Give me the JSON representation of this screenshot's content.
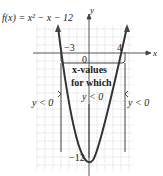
{
  "function_label": "f(x) = x² − x − 12",
  "axes": {
    "x_label": "x",
    "y_label": "y",
    "origin_label": "0"
  },
  "intercepts": {
    "left": "−3",
    "right": "4"
  },
  "vertex_label": "−12",
  "annotation": {
    "line1": "x-values",
    "line2": "for which",
    "line3": "y < 0"
  },
  "side_labels": {
    "left": "y < 0",
    "right": "y < 0"
  },
  "colors": {
    "curve": "#333333",
    "grid": "#b5b5b5",
    "axis": "#444444"
  }
}
